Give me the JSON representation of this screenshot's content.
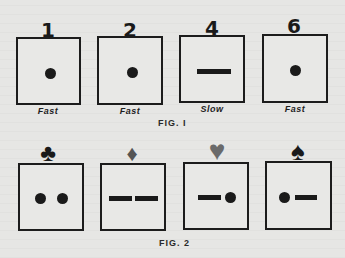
{
  "figure1": {
    "caption": "FIG. I",
    "cards": [
      {
        "number": "1",
        "symbol": "dot",
        "speed": "Fast"
      },
      {
        "number": "2",
        "symbol": "dot",
        "speed": "Fast"
      },
      {
        "number": "4",
        "symbol": "dash",
        "speed": "Slow"
      },
      {
        "number": "6",
        "symbol": "dot",
        "speed": "Fast"
      }
    ]
  },
  "figure2": {
    "caption": "FIG. 2",
    "cards": [
      {
        "suit": "club",
        "suit_glyph": "♣",
        "symbols": [
          "dot",
          "dot"
        ]
      },
      {
        "suit": "diamond",
        "suit_glyph": "♦",
        "symbols": [
          "dash",
          "dash"
        ]
      },
      {
        "suit": "heart",
        "suit_glyph": "♥",
        "symbols": [
          "dash",
          "dot"
        ]
      },
      {
        "suit": "spade",
        "suit_glyph": "♠",
        "symbols": [
          "dot",
          "dash"
        ]
      }
    ]
  },
  "colors": {
    "ink": "#1a1a1a",
    "diamond": "#555555",
    "heart": "#6a6a6a",
    "paper": "#e6e6e4"
  }
}
